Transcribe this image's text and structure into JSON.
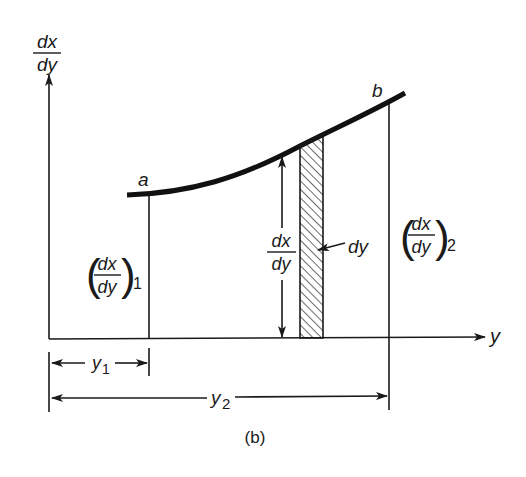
{
  "figure": {
    "caption": "(b)",
    "axes": {
      "vertical_label": {
        "numerator": "dx",
        "denominator": "dy"
      },
      "horizontal_label": "y"
    },
    "curve": {
      "start_label": "a",
      "end_label": "b"
    },
    "ordinate_a": {
      "numerator": "dx",
      "denominator": "dy",
      "subscript": "1",
      "open_paren": "(",
      "close_paren": ")"
    },
    "ordinate_b": {
      "numerator": "dx",
      "denominator": "dy",
      "subscript": "2",
      "open_paren": "(",
      "close_paren": ")"
    },
    "strip_height": {
      "numerator": "dx",
      "denominator": "dy"
    },
    "strip_width_label": "dy",
    "dimension_y1": {
      "base": "y",
      "subscript": "1"
    },
    "dimension_y2": {
      "base": "y",
      "subscript": "2"
    }
  },
  "colors": {
    "ink": "#1a1a1a",
    "background": "#ffffff"
  }
}
